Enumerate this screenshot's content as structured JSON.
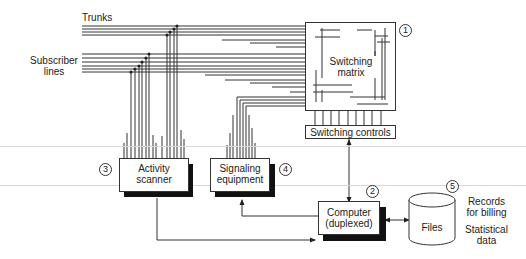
{
  "diagram": {
    "inputs": {
      "trunks_label": "Trunks",
      "subscriber_lines_label_line1": "Subscriber",
      "subscriber_lines_label_line2": "lines"
    },
    "blocks": {
      "switching_matrix": {
        "label_line1": "Switching",
        "label_line2": "matrix",
        "number": "1"
      },
      "switching_controls": {
        "label": "Switching controls"
      },
      "computer": {
        "label_line1": "Computer",
        "label_line2": "(duplexed)",
        "number": "2"
      },
      "activity_scanner": {
        "label_line1": "Activity",
        "label_line2": "scanner",
        "number": "3"
      },
      "signaling_equipment": {
        "label_line1": "Signaling",
        "label_line2": "equipment",
        "number": "4"
      },
      "files": {
        "label": "Files",
        "number": "5"
      }
    },
    "annotations": {
      "records_line1": "Records",
      "records_line2": "for billing",
      "stats_line1": "Statistical",
      "stats_line2": "data"
    },
    "connections": [
      {
        "from": "trunks",
        "to": "switching_matrix"
      },
      {
        "from": "subscriber_lines",
        "to": "switching_matrix"
      },
      {
        "from": "subscriber_lines",
        "to": "activity_scanner"
      },
      {
        "from": "trunks",
        "to": "activity_scanner"
      },
      {
        "from": "switching_matrix",
        "to": "signaling_equipment"
      },
      {
        "from": "switching_controls",
        "to": "switching_matrix"
      },
      {
        "from": "computer",
        "to": "switching_controls",
        "bidirectional": true
      },
      {
        "from": "activity_scanner",
        "to": "computer"
      },
      {
        "from": "computer",
        "to": "signaling_equipment"
      },
      {
        "from": "computer",
        "to": "files",
        "bidirectional": true
      }
    ],
    "colors": {
      "line": "#333333",
      "shadow": "#111111",
      "background": "#ffffff"
    }
  }
}
